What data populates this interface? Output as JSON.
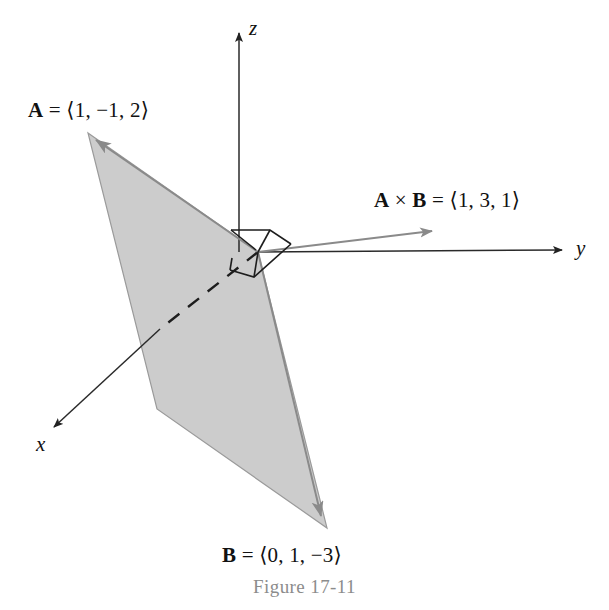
{
  "figure": {
    "caption": "Figure 17-11",
    "background_color": "#ffffff",
    "plane_fill_color": "#cccccc",
    "plane_edge_color": "#8a8a8a",
    "axis_color": "#222222",
    "cross_arrow_color": "#7d7d7d",
    "caption_color": "#8c8c8c"
  },
  "axes": [
    {
      "name": "x-axis",
      "label": "x",
      "tip": [
        50,
        430
      ]
    },
    {
      "name": "y-axis",
      "label": "y",
      "tip": [
        566,
        250
      ]
    },
    {
      "name": "z-axis",
      "label": "z",
      "tip": [
        243,
        28
      ]
    }
  ],
  "vectors": {
    "a": {
      "name": "A",
      "label": "A = ⟨1, −1, 2⟩",
      "symbol": "A",
      "equals": "=",
      "components": [
        1,
        -1,
        2
      ],
      "components_text": "⟨1, −1, 2⟩",
      "tip": [
        88,
        133
      ]
    },
    "b": {
      "name": "B",
      "label": "B = ⟨0, 1, −3⟩",
      "symbol": "B",
      "equals": "=",
      "components": [
        0,
        1,
        -3
      ],
      "components_text": "⟨0, 1, −3⟩",
      "tip": [
        327,
        528
      ]
    },
    "cross": {
      "name": "A cross B",
      "label": "A × B = ⟨1, 3, 1⟩",
      "symbol_a": "A",
      "times": "×",
      "symbol_b": "B",
      "equals": "=",
      "components": [
        1,
        3,
        1
      ],
      "components_text": "⟨1, 3, 1⟩",
      "tip": [
        443,
        227
      ]
    }
  },
  "parallelogram": {
    "name": "vector-plane",
    "vertices": [
      [
        88,
        133
      ],
      [
        258,
        252
      ],
      [
        327,
        528
      ],
      [
        157,
        409
      ]
    ]
  },
  "right_angle_marker": {
    "name": "right-angle-marker",
    "present": true
  },
  "origin": [
    258,
    252
  ]
}
